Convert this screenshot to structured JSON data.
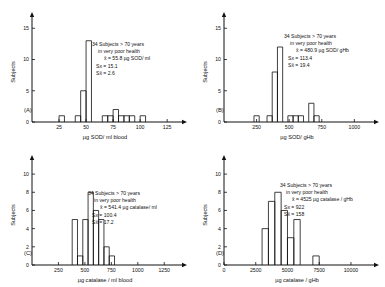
{
  "figure": {
    "title": "",
    "panel_count": 4
  },
  "chart_data": [
    {
      "type": "bar",
      "panel_id": "(A)",
      "title": "",
      "xlabel": "µg  SOD/ ml  blood",
      "ylabel": "Subjects",
      "xlim": [
        0,
        135
      ],
      "ylim": [
        0,
        16
      ],
      "xticks": [
        25,
        50,
        75,
        100,
        125
      ],
      "yticks": [
        0,
        5,
        10,
        15
      ],
      "grid": false,
      "bin_width": 5,
      "bin_starts": [
        25,
        40,
        45,
        50,
        65,
        70,
        75,
        80,
        85,
        90,
        100
      ],
      "values": [
        1,
        1,
        5,
        13,
        1,
        1,
        2,
        1,
        1,
        1,
        1
      ],
      "annotation": {
        "line1": "34  Subjects > 70 years",
        "line2": "in very poor health",
        "line3": "x̄ = 55.8 µg SOD/ ml",
        "line4": "Sx = 15.1",
        "line5": "Sx̄ = 2.6"
      }
    },
    {
      "type": "bar",
      "panel_id": "(B)",
      "title": "",
      "xlabel": "µg SOD/ gHb",
      "ylabel": "Subjects",
      "xlim": [
        0,
        1120
      ],
      "ylim": [
        0,
        16
      ],
      "xticks": [
        250,
        500,
        750,
        1000
      ],
      "yticks": [
        0,
        5,
        10,
        15
      ],
      "grid": false,
      "bin_width": 40,
      "bin_starts": [
        230,
        330,
        370,
        410,
        490,
        530,
        570,
        650,
        690
      ],
      "values": [
        1,
        1,
        8,
        12,
        1,
        1,
        1,
        3,
        1
      ],
      "annotation": {
        "line1": "34  Subjects > 70 years",
        "line2": "in very poor  health",
        "line3": "x̄ = 480.9 µg SOD/ gHb",
        "line4": "Sx = 113.4",
        "line5": "Sx̄ = 19.4"
      }
    },
    {
      "type": "bar",
      "panel_id": "(C)",
      "title": "",
      "xlabel": "µg  catalase / ml  blood",
      "ylabel": "Subjects",
      "xlim": [
        0,
        1380
      ],
      "ylim": [
        0,
        11
      ],
      "xticks": [
        250,
        500,
        750,
        1000,
        1250
      ],
      "yticks": [
        0,
        2,
        4,
        6,
        8,
        10
      ],
      "grid": false,
      "bin_width": 50,
      "bin_starts": [
        380,
        430,
        480,
        530,
        580,
        630,
        680,
        730
      ],
      "values": [
        5,
        1,
        5,
        8,
        6,
        5,
        2,
        1
      ],
      "annotation": {
        "line1": "34  Subjects > 70 years",
        "line2": "in very  poor health",
        "line3": "x̄ = 541.4 µg catalase/ ml",
        "line4": "Sx = 100.4",
        "line5": "Sx̄ = 17.2"
      }
    },
    {
      "type": "bar",
      "panel_id": "(D)",
      "title": "",
      "xlabel": "µg  catalase / gHb",
      "ylabel": "Subjects",
      "xlim": [
        0,
        11500
      ],
      "ylim": [
        0,
        11
      ],
      "xticks": [
        0,
        2500,
        5000,
        7500,
        10000
      ],
      "yticks": [
        0,
        2,
        4,
        6,
        8,
        10
      ],
      "grid": false,
      "bin_width": 500,
      "bin_starts": [
        3000,
        3500,
        4000,
        4500,
        5000,
        5500,
        7000
      ],
      "values": [
        4,
        7,
        8,
        6,
        3,
        5,
        1
      ],
      "annotation": {
        "line1": "34  Subjects > 70 years",
        "line2": "in very poor  health",
        "line3": "x̄ = 4525 µg catalase / gHb",
        "line4": "Sx = 922",
        "line5": "Sx̄ = 158"
      }
    }
  ],
  "colors": {
    "ink": "#111111",
    "background": "#ffffff"
  }
}
